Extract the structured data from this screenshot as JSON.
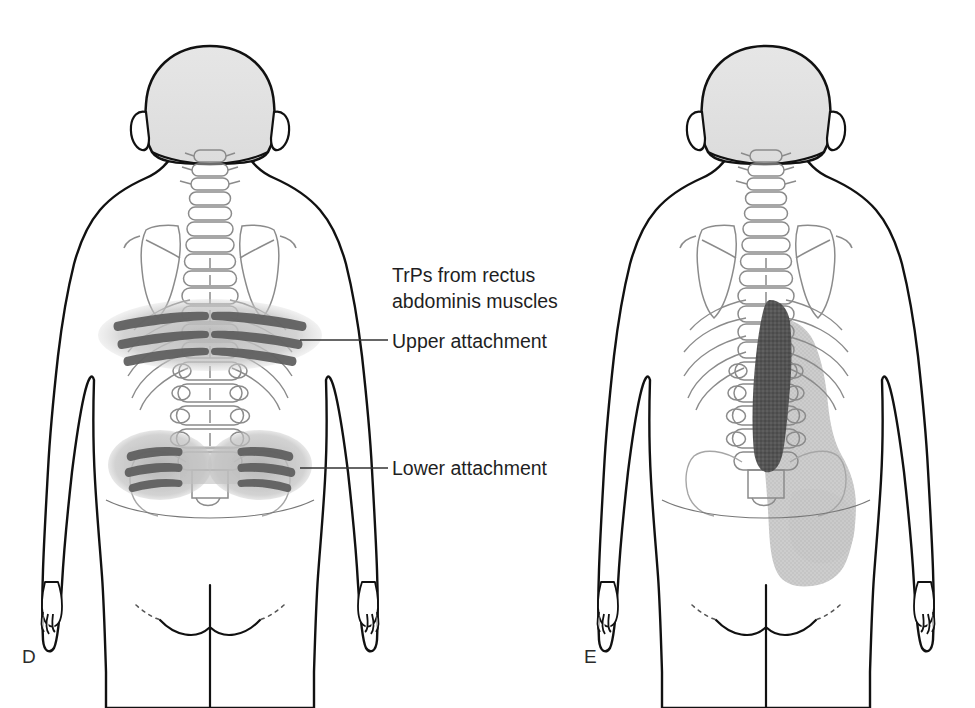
{
  "figure": {
    "type": "medical-illustration",
    "background_color": "#ffffff",
    "panels": [
      {
        "id": "D",
        "letter": "D",
        "body_view": "posterior",
        "markings": [
          {
            "name": "upper-attachment-trigger-points",
            "shape": "bilateral horizontal bands across mid-back at lower thoracic level",
            "band_count": 6,
            "dark_color": "#5d5d5d",
            "halo_color": "#bdbdbd"
          },
          {
            "name": "lower-attachment-trigger-points",
            "shape": "bilateral oval clusters over sacroiliac / gluteal region",
            "band_count": 6,
            "dark_color": "#5d5d5d",
            "halo_color": "#b5b5b5"
          }
        ]
      },
      {
        "id": "E",
        "letter": "E",
        "body_view": "posterior",
        "markings": [
          {
            "name": "essential-pain-zone",
            "shape": "dark vertical band along right paraspinal lumbar region",
            "dark_color": "#4a4a4a"
          },
          {
            "name": "spillover-pain-zone",
            "shape": "stippled light region extending over right flank and buttock",
            "stipple_color": "#c6c6c6"
          }
        ]
      }
    ]
  },
  "callouts": {
    "title_line1": "TrPs from rectus",
    "title_line2": "abdominis muscles",
    "upper_label": "Upper attachment",
    "lower_label": "Lower attachment"
  },
  "colors": {
    "outline": "#111111",
    "skeleton": "#8b8b8b",
    "hair_fill": "#e0e0e0",
    "trigger_dark": "#5d5d5d",
    "trigger_halo": "#bcbcbc",
    "pain_essential": "#4a4a4a",
    "pain_spillover": "#c8c8c8",
    "leader_line": "#333333",
    "text": "#1f1f1f"
  }
}
